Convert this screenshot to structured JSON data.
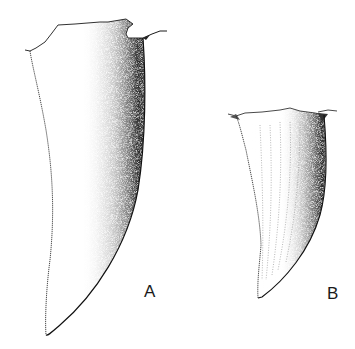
{
  "figure": {
    "panels": [
      {
        "id": "A",
        "label": "A",
        "subject": "tooth (lateral view, large)"
      },
      {
        "id": "B",
        "label": "B",
        "subject": "tooth (lateral view, small, with longitudinal ridges)"
      }
    ],
    "colors": {
      "background": "#ffffff",
      "ink": "#1a1a1a",
      "shade_dark": "#222222",
      "shade_mid": "#777777"
    }
  }
}
